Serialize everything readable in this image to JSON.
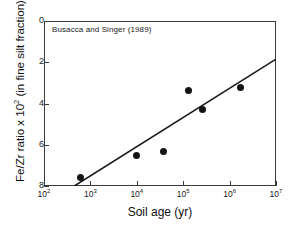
{
  "figure": {
    "annotation": "Busacca and Singer (1989)"
  },
  "chart_data": {
    "type": "scatter",
    "title": "",
    "annotation": "Busacca and Singer (1989)",
    "xlabel": "Soil age (yr)",
    "ylabel": "Fe/Zr ratio x 10² (in fine silt fraction)",
    "ylabel_parts": {
      "prefix": "Fe/Zr ratio x 10",
      "exponent": "2",
      "suffix": " (in fine silt fraction)"
    },
    "xscale": "log",
    "yscale": "linear",
    "xlim": [
      100,
      10000000
    ],
    "ylim": [
      8,
      0
    ],
    "y_inverted": true,
    "grid": false,
    "legend": null,
    "xticks": [
      100,
      1000,
      10000,
      100000,
      1000000,
      10000000
    ],
    "xticklabels": [
      "10²",
      "10³",
      "10⁴",
      "10⁵",
      "10⁶",
      "10⁷"
    ],
    "xtick_mantissa": [
      "10",
      "10",
      "10",
      "10",
      "10",
      "10"
    ],
    "xtick_exponents": [
      "2",
      "3",
      "4",
      "5",
      "6",
      "7"
    ],
    "yticks": [
      0,
      2,
      4,
      6,
      8
    ],
    "yticklabels": [
      "0",
      "2",
      "4",
      "6",
      "8"
    ],
    "points": [
      {
        "x": 600,
        "y": 7.6
      },
      {
        "x": 10000,
        "y": 6.5
      },
      {
        "x": 37000,
        "y": 6.35
      },
      {
        "x": 130000,
        "y": 3.35
      },
      {
        "x": 260000,
        "y": 4.3
      },
      {
        "x": 1700000,
        "y": 3.2
      }
    ],
    "trendline": {
      "x": [
        450,
        10000000
      ],
      "y": [
        8.0,
        1.85
      ]
    },
    "marker_color": "#141414",
    "line_color": "#1a1a1a",
    "axis_color": "#3a3a3a"
  }
}
